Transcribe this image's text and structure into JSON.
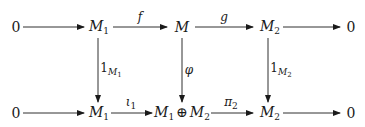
{
  "diagram": {
    "type": "commutative-diagram",
    "top_row": {
      "nodes": [
        {
          "id": "t0",
          "label": "0"
        },
        {
          "id": "t1",
          "label": "M",
          "sub": "1"
        },
        {
          "id": "t2",
          "label": "M"
        },
        {
          "id": "t3",
          "label": "M",
          "sub": "2"
        },
        {
          "id": "t4",
          "label": "0"
        }
      ],
      "arrows": [
        {
          "from": "t0",
          "to": "t1",
          "label": ""
        },
        {
          "from": "t1",
          "to": "t2",
          "label": "f"
        },
        {
          "from": "t2",
          "to": "t3",
          "label": "g"
        },
        {
          "from": "t3",
          "to": "t4",
          "label": ""
        }
      ]
    },
    "bottom_row": {
      "nodes": [
        {
          "id": "b0",
          "label": "0"
        },
        {
          "id": "b1",
          "label": "M",
          "sub": "1"
        },
        {
          "id": "b2",
          "label": "M₁ ⊕ M₂",
          "left": "M",
          "left_sub": "1",
          "op": "⊕",
          "right": "M",
          "right_sub": "2"
        },
        {
          "id": "b3",
          "label": "M",
          "sub": "2"
        },
        {
          "id": "b4",
          "label": "0"
        }
      ],
      "arrows": [
        {
          "from": "b0",
          "to": "b1",
          "label": ""
        },
        {
          "from": "b1",
          "to": "b2",
          "label": "ι",
          "label_sub": "1"
        },
        {
          "from": "b2",
          "to": "b3",
          "label": "π",
          "label_sub": "2"
        },
        {
          "from": "b3",
          "to": "b4",
          "label": ""
        }
      ]
    },
    "vertical_arrows": [
      {
        "from": "t1",
        "to": "b1",
        "label": "1",
        "label_sub": "M",
        "label_sub_sub": "1"
      },
      {
        "from": "t2",
        "to": "b2",
        "label": "φ"
      },
      {
        "from": "t3",
        "to": "b3",
        "label": "1",
        "label_sub": "M",
        "label_sub_sub": "2"
      }
    ],
    "colors": {
      "stroke": "#1a1a1a",
      "background": "#ffffff"
    }
  }
}
